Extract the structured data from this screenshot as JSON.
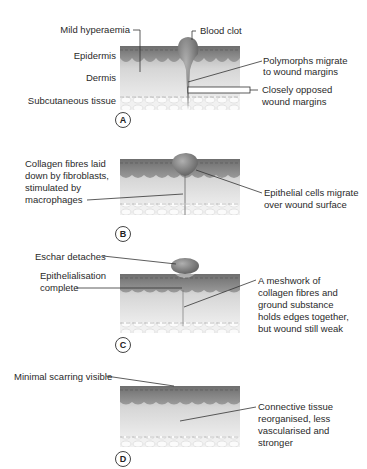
{
  "figure": {
    "colors": {
      "epidermis": "#8a8a8a",
      "dermis_top": "#bdbdbd",
      "dermis_bottom": "#f2f2f2",
      "clot": "#7d7d7d",
      "leader": "#333333"
    }
  },
  "panels": [
    {
      "letter": "A",
      "labels": {
        "mild_hyperaemia": "Mild hyperaemia",
        "blood_clot": "Blood clot",
        "epidermis": "Epidermis",
        "dermis": "Dermis",
        "subcutaneous": "Subcutaneous tissue",
        "polymorphs_1": "Polymorphs migrate",
        "polymorphs_2": "to wound margins",
        "opposed_1": "Closely opposed",
        "opposed_2": "wound margins"
      }
    },
    {
      "letter": "B",
      "labels": {
        "collagen_1": "Collagen fibres laid",
        "collagen_2": "down by fibroblasts,",
        "collagen_3": "stimulated by",
        "collagen_4": "macrophages",
        "epithelial_1": "Epithelial cells migrate",
        "epithelial_2": "over wound surface"
      }
    },
    {
      "letter": "C",
      "labels": {
        "eschar": "Eschar detaches",
        "epith_1": "Epithelialisation",
        "epith_2": "complete",
        "mesh_1": "A meshwork of",
        "mesh_2": "collagen fibres and",
        "mesh_3": "ground substance",
        "mesh_4": "holds edges together,",
        "mesh_5": "but wound still weak"
      }
    },
    {
      "letter": "D",
      "labels": {
        "scarring": "Minimal scarring visible",
        "conn_1": "Connective tissue",
        "conn_2": "reorganised, less",
        "conn_3": "vascularised and",
        "conn_4": "stronger"
      }
    }
  ]
}
